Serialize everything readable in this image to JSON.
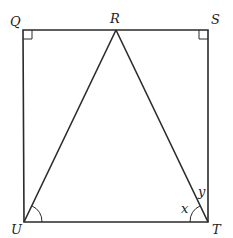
{
  "diagram": {
    "title": "",
    "points": {
      "Q": {
        "label": "Q",
        "x": 23,
        "y": 30
      },
      "R": {
        "label": "R",
        "x": 116,
        "y": 30
      },
      "S": {
        "label": "S",
        "x": 208,
        "y": 30
      },
      "U": {
        "label": "U",
        "x": 24,
        "y": 222
      },
      "T": {
        "label": "T",
        "x": 208,
        "y": 222
      }
    },
    "angle_labels": {
      "x": "x",
      "y": "y"
    },
    "right_angles": [
      "Q",
      "S"
    ],
    "marked_angles": [
      "RUT",
      "UTR"
    ],
    "colors": {
      "stroke": "#2a2a2a",
      "background": "#ffffff"
    }
  }
}
